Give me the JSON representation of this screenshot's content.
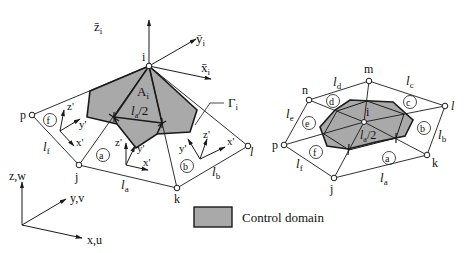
{
  "colors": {
    "domain_fill": "#a9a9a9",
    "line": "#1a1a1a",
    "background": "#ffffff"
  },
  "left_diagram": {
    "nodes": {
      "i": "i",
      "p": "p",
      "j": "j",
      "k": "k",
      "l": "l"
    },
    "local_axes": {
      "z": "z̄",
      "y": "ȳ",
      "x": "x̄",
      "sub": "i"
    },
    "area_label": {
      "main": "A",
      "sub": "i"
    },
    "boundary_label": {
      "main": "Γ",
      "sub": "i"
    },
    "half_length": {
      "main": "l",
      "sub": "a",
      "suffix": "/2"
    },
    "element_labels": [
      "f",
      "a",
      "b"
    ],
    "edge_labels": {
      "lf": {
        "main": "l",
        "sub": "f"
      },
      "la": {
        "main": "l",
        "sub": "a"
      },
      "lb": {
        "main": "l",
        "sub": "b"
      }
    },
    "element_axes": {
      "z": "z'",
      "y": "y'",
      "x": "x'"
    }
  },
  "global_axes": {
    "z": "z,w",
    "y": "y,v",
    "x": "x,u"
  },
  "legend": {
    "label": "Control domain"
  },
  "right_diagram": {
    "nodes": {
      "i": "i",
      "m": "m",
      "n": "n",
      "p": "p",
      "j": "j",
      "k": "k",
      "l": "l"
    },
    "element_labels": [
      "a",
      "b",
      "c",
      "d",
      "e",
      "f"
    ],
    "edge_labels": {
      "la": {
        "main": "l",
        "sub": "a"
      },
      "lb": {
        "main": "l",
        "sub": "b"
      },
      "lc": {
        "main": "l",
        "sub": "c"
      },
      "ld": {
        "main": "l",
        "sub": "d"
      },
      "le": {
        "main": "l",
        "sub": "e"
      },
      "lf": {
        "main": "l",
        "sub": "f"
      }
    },
    "half_length": {
      "main": "l",
      "sub": "a",
      "suffix": "/2"
    }
  }
}
